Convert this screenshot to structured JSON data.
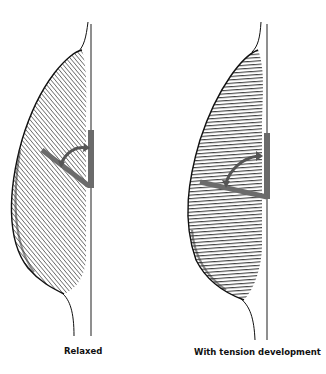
{
  "figure": {
    "panels": [
      {
        "id": "relaxed",
        "label": "Relaxed",
        "fiber_orientation": "diagonal (pennate angle larger)",
        "hatch_angle_deg": 40
      },
      {
        "id": "tension",
        "label": "With tension development",
        "fiber_orientation": "more horizontal (pennate angle reduced)",
        "hatch_angle_deg": 5
      }
    ],
    "colors": {
      "outline": "#1a1a1a",
      "hatching": "#2a2a2a",
      "aponeurosis": "#6b6b6b",
      "arrow": "#6b6b6b",
      "background": "#ffffff"
    }
  }
}
